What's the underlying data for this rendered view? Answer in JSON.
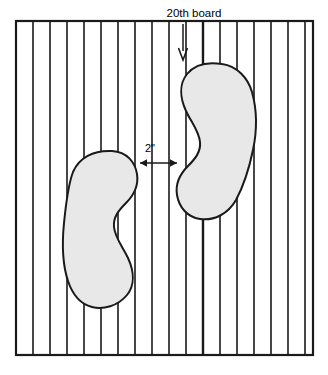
{
  "diagram": {
    "colors": {
      "stroke": "#1a1a1a",
      "footprint_fill": "#e8e8e8",
      "background": "#ffffff",
      "text": "#000000"
    },
    "frame": {
      "x": 16,
      "y": 21,
      "width": 297,
      "height": 334,
      "border_width": 2.2
    },
    "boards": {
      "count": 18,
      "line_width": 1.6,
      "highlighted_index": 10,
      "highlighted_line_width": 2.4,
      "x_positions": [
        33,
        50,
        67,
        84,
        101,
        118,
        135,
        152,
        169,
        186,
        203,
        220,
        237,
        254,
        271,
        288,
        305
      ]
    },
    "labels": {
      "board_label": "20th board",
      "board_label_x": 194,
      "board_label_y": 13,
      "board_label_size": 11.5,
      "dimension_label": "2\"",
      "dimension_label_x": 150,
      "dimension_label_y": 152,
      "dimension_label_size": 11
    },
    "pointer_arrow": {
      "x": 183,
      "y_start": 24,
      "y_end": 60,
      "direction": "down",
      "head_width": 9,
      "head_height": 12
    },
    "dimension_line": {
      "y": 163,
      "x_start": 140,
      "x_end": 177,
      "arrow_size": 7,
      "ticks": [
        140,
        169,
        177
      ]
    },
    "footprints": [
      {
        "name": "left-footprint",
        "path": "M 112 151 C 127 152 135 162 137 174 C 139 187 133 196 126 203 C 119 210 113 217 114 227 C 115 238 123 247 128 258 C 134 271 135 285 127 295 C 118 306 103 310 92 307 C 80 304 72 293 68 281 C 62 263 62 243 64 223 C 66 203 68 185 73 172 C 79 158 93 150 112 151 Z"
      },
      {
        "name": "right-footprint",
        "path": "M 222 64 C 237 66 248 78 252 92 C 257 110 257 131 253 150 C 249 169 243 187 236 200 C 228 214 214 221 200 219 C 187 217 179 207 177 195 C 175 183 181 173 188 166 C 195 159 201 152 200 142 C 199 131 191 122 186 111 C 180 98 179 84 187 74 C 196 63 210 62 222 64 Z"
      }
    ]
  }
}
